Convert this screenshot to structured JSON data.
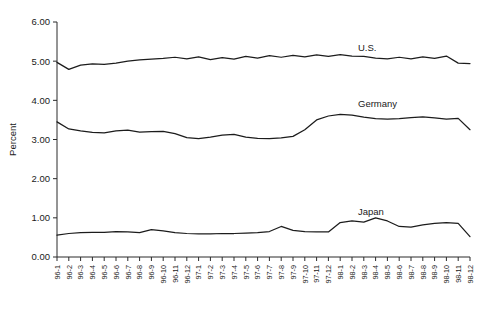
{
  "chart_data": {
    "type": "line",
    "title": "",
    "xlabel": "",
    "ylabel": "Percent",
    "ylim": [
      0,
      6
    ],
    "yticks": [
      0,
      1,
      2,
      3,
      4,
      5,
      6
    ],
    "ytick_labels": [
      "0.00",
      "1.00",
      "2.00",
      "3.00",
      "4.00",
      "5.00",
      "6.00"
    ],
    "grid": false,
    "legend_position": "inline-right",
    "categories": [
      "96-1",
      "96-2",
      "96-3",
      "96-4",
      "96-5",
      "96-6",
      "96-7",
      "96-8",
      "96-9",
      "96-10",
      "96-11",
      "96-12",
      "97-1",
      "97-2",
      "97-3",
      "97-4",
      "97-5",
      "97-6",
      "97-7",
      "97-8",
      "97-9",
      "97-10",
      "97-11",
      "97-12",
      "98-1",
      "98-2",
      "98-3",
      "98-4",
      "98-5",
      "98-6",
      "98-7",
      "98-8",
      "98-9",
      "98-10",
      "98-11",
      "98-12"
    ],
    "series": [
      {
        "name": "U.S.",
        "label_x": 358,
        "label_y": 51,
        "values": [
          4.97,
          4.79,
          4.9,
          4.93,
          4.92,
          4.95,
          5.0,
          5.03,
          5.05,
          5.07,
          5.1,
          5.06,
          5.11,
          5.04,
          5.09,
          5.05,
          5.12,
          5.08,
          5.14,
          5.1,
          5.15,
          5.11,
          5.16,
          5.12,
          5.17,
          5.13,
          5.12,
          5.08,
          5.06,
          5.1,
          5.06,
          5.11,
          5.07,
          5.13,
          4.95,
          4.94
        ]
      },
      {
        "name": "Germany",
        "label_x": 358,
        "label_y": 107,
        "values": [
          3.45,
          3.27,
          3.22,
          3.18,
          3.17,
          3.22,
          3.24,
          3.19,
          3.2,
          3.21,
          3.15,
          3.05,
          3.02,
          3.06,
          3.11,
          3.13,
          3.06,
          3.03,
          3.02,
          3.04,
          3.08,
          3.25,
          3.5,
          3.6,
          3.64,
          3.62,
          3.57,
          3.53,
          3.52,
          3.53,
          3.56,
          3.58,
          3.55,
          3.52,
          3.54,
          3.25
        ]
      },
      {
        "name": "Japan",
        "label_x": 358,
        "label_y": 215,
        "values": [
          0.56,
          0.6,
          0.62,
          0.63,
          0.63,
          0.65,
          0.64,
          0.62,
          0.7,
          0.67,
          0.62,
          0.6,
          0.59,
          0.59,
          0.6,
          0.6,
          0.61,
          0.62,
          0.65,
          0.78,
          0.68,
          0.65,
          0.64,
          0.64,
          0.88,
          0.92,
          0.89,
          1.0,
          0.92,
          0.78,
          0.76,
          0.82,
          0.86,
          0.88,
          0.86,
          0.52
        ]
      }
    ]
  }
}
